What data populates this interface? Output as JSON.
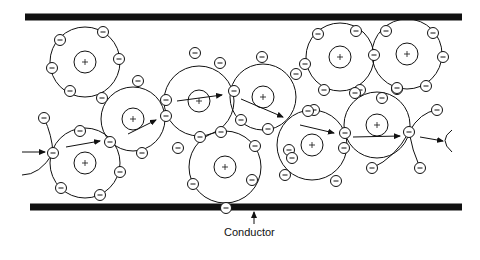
{
  "diagram": {
    "label": "Conductor",
    "colors": {
      "ink": "#111111",
      "background": "#ffffff"
    },
    "conductor_walls": [
      {
        "name": "top-wall",
        "x1": 25,
        "x2": 462,
        "y": 17,
        "thickness": 7
      },
      {
        "name": "bottom-wall",
        "x1": 30,
        "x2": 462,
        "y": 207,
        "thickness": 7
      }
    ],
    "atoms": [
      {
        "cx": 85,
        "cy": 62,
        "r": 35
      },
      {
        "cx": 133,
        "cy": 119,
        "r": 32
      },
      {
        "cx": 85,
        "cy": 163,
        "r": 35
      },
      {
        "cx": 199,
        "cy": 101,
        "r": 35
      },
      {
        "cx": 263,
        "cy": 97,
        "r": 33
      },
      {
        "cx": 225,
        "cy": 167,
        "r": 36
      },
      {
        "cx": 340,
        "cy": 57,
        "r": 34
      },
      {
        "cx": 407,
        "cy": 54,
        "r": 35
      },
      {
        "cx": 312,
        "cy": 145,
        "r": 35
      },
      {
        "cx": 377,
        "cy": 125,
        "r": 33
      }
    ],
    "electrons": [
      [
        60,
        40
      ],
      [
        103,
        32
      ],
      [
        119,
        59
      ],
      [
        52,
        68
      ],
      [
        70,
        91
      ],
      [
        138,
        81
      ],
      [
        102,
        98
      ],
      [
        166,
        116
      ],
      [
        142,
        153
      ],
      [
        166,
        100
      ],
      [
        44,
        118
      ],
      [
        80,
        131
      ],
      [
        53,
        153
      ],
      [
        110,
        142
      ],
      [
        120,
        172
      ],
      [
        61,
        188
      ],
      [
        100,
        195
      ],
      [
        195,
        53
      ],
      [
        220,
        63
      ],
      [
        200,
        137
      ],
      [
        234,
        91
      ],
      [
        262,
        57
      ],
      [
        296,
        74
      ],
      [
        241,
        120
      ],
      [
        268,
        129
      ],
      [
        289,
        150
      ],
      [
        221,
        132
      ],
      [
        255,
        146
      ],
      [
        178,
        148
      ],
      [
        193,
        184
      ],
      [
        252,
        180
      ],
      [
        226,
        208
      ],
      [
        318,
        34
      ],
      [
        356,
        31
      ],
      [
        305,
        64
      ],
      [
        324,
        90
      ],
      [
        360,
        90
      ],
      [
        374,
        55
      ],
      [
        386,
        31
      ],
      [
        433,
        33
      ],
      [
        443,
        57
      ],
      [
        426,
        86
      ],
      [
        397,
        89
      ],
      [
        355,
        93
      ],
      [
        382,
        98
      ],
      [
        314,
        110
      ],
      [
        308,
        111
      ],
      [
        345,
        133
      ],
      [
        292,
        158
      ],
      [
        336,
        181
      ],
      [
        285,
        175
      ],
      [
        397,
        88
      ],
      [
        409,
        132
      ],
      [
        437,
        110
      ],
      [
        420,
        168
      ],
      [
        372,
        168
      ],
      [
        344,
        148
      ]
    ],
    "arrows": [
      {
        "x1": 22,
        "y1": 152,
        "x2": 45,
        "y2": 152
      },
      {
        "x1": 66,
        "y1": 147,
        "x2": 100,
        "y2": 141
      },
      {
        "x1": 128,
        "y1": 134,
        "x2": 156,
        "y2": 120
      },
      {
        "x1": 177,
        "y1": 101,
        "x2": 222,
        "y2": 95
      },
      {
        "x1": 241,
        "y1": 99,
        "x2": 283,
        "y2": 117
      },
      {
        "x1": 300,
        "y1": 125,
        "x2": 334,
        "y2": 133
      },
      {
        "x1": 353,
        "y1": 137,
        "x2": 400,
        "y2": 136
      },
      {
        "x1": 420,
        "y1": 137,
        "x2": 443,
        "y2": 141
      },
      {
        "x1": 254,
        "y1": 224,
        "x2": 254,
        "y2": 212
      }
    ],
    "label_pos": {
      "x": 225,
      "y": 233
    }
  }
}
